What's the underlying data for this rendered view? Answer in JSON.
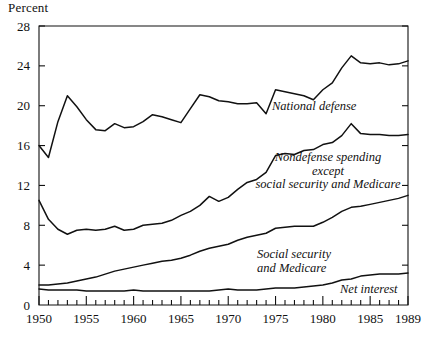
{
  "chart_data": {
    "type": "line",
    "title": "",
    "subtitle": "",
    "unit_label": "Percent",
    "xlabel": "",
    "ylabel": "Percent",
    "xlim": [
      1950,
      1989
    ],
    "ylim": [
      0,
      28
    ],
    "ytick_step": 4,
    "grid": false,
    "legend_position": "inline-annotations",
    "x_major_ticks": [
      1950,
      1955,
      1960,
      1965,
      1970,
      1975,
      1980,
      1985,
      1989
    ],
    "x_tick_labels": [
      "1950",
      "1955",
      "1960",
      "1965",
      "1970",
      "1975",
      "1980",
      "1985",
      "1989"
    ],
    "y_tick_labels": [
      "0",
      "4",
      "8",
      "12",
      "16",
      "20",
      "24",
      "28"
    ],
    "y_ticks": [
      0,
      4,
      8,
      12,
      16,
      20,
      24,
      28
    ],
    "x": [
      1950,
      1951,
      1952,
      1953,
      1954,
      1955,
      1956,
      1957,
      1958,
      1959,
      1960,
      1961,
      1962,
      1963,
      1964,
      1965,
      1966,
      1967,
      1968,
      1969,
      1970,
      1971,
      1972,
      1973,
      1974,
      1975,
      1976,
      1977,
      1978,
      1979,
      1980,
      1981,
      1982,
      1983,
      1984,
      1985,
      1986,
      1987,
      1988,
      1989
    ],
    "series": [
      {
        "name": "National defense",
        "annotation": "National defense",
        "values": [
          16.0,
          14.8,
          18.4,
          21.0,
          19.9,
          18.6,
          17.6,
          17.5,
          18.2,
          17.8,
          17.9,
          18.4,
          19.1,
          18.9,
          18.6,
          18.3,
          19.7,
          21.1,
          20.9,
          20.5,
          20.4,
          20.2,
          20.2,
          20.3,
          19.2,
          21.6,
          21.4,
          21.2,
          21.0,
          20.6,
          21.6,
          22.3,
          23.8,
          25.0,
          24.3,
          24.2,
          24.3,
          24.1,
          24.2,
          24.5
        ]
      },
      {
        "name": "Nondefense spending except social security and Medicare",
        "annotation": [
          "Nondefense spending",
          "except",
          "social security and Medicare"
        ],
        "values": [
          10.5,
          8.6,
          7.6,
          7.1,
          7.5,
          7.6,
          7.5,
          7.6,
          7.9,
          7.5,
          7.6,
          8.0,
          8.1,
          8.2,
          8.5,
          9.0,
          9.4,
          10.0,
          10.9,
          10.4,
          10.8,
          11.6,
          12.3,
          12.6,
          13.3,
          15.0,
          15.2,
          15.1,
          15.5,
          15.6,
          16.1,
          16.3,
          17.0,
          18.2,
          17.2,
          17.1,
          17.1,
          17.0,
          17.0,
          17.1
        ]
      },
      {
        "name": "Social security and Medicare",
        "annotation": [
          "Social security",
          "and Medicare"
        ],
        "values": [
          2.0,
          2.0,
          2.1,
          2.2,
          2.4,
          2.6,
          2.8,
          3.1,
          3.4,
          3.6,
          3.8,
          4.0,
          4.2,
          4.4,
          4.5,
          4.7,
          5.0,
          5.4,
          5.7,
          5.9,
          6.1,
          6.5,
          6.8,
          7.0,
          7.2,
          7.7,
          7.8,
          7.9,
          7.9,
          7.9,
          8.3,
          8.8,
          9.4,
          9.8,
          9.9,
          10.1,
          10.3,
          10.5,
          10.7,
          11.0
        ]
      },
      {
        "name": "Net interest",
        "annotation": "Net interest",
        "values": [
          1.6,
          1.5,
          1.5,
          1.5,
          1.5,
          1.4,
          1.4,
          1.4,
          1.4,
          1.4,
          1.5,
          1.4,
          1.4,
          1.4,
          1.4,
          1.4,
          1.4,
          1.4,
          1.4,
          1.5,
          1.6,
          1.5,
          1.5,
          1.5,
          1.6,
          1.7,
          1.7,
          1.7,
          1.8,
          1.9,
          2.0,
          2.2,
          2.5,
          2.6,
          2.9,
          3.0,
          3.1,
          3.1,
          3.1,
          3.2
        ]
      }
    ],
    "line_color": "#111111",
    "axis_color": "#111111",
    "background_color": "#ffffff"
  },
  "annotations": {
    "national_defense": "National defense",
    "nondefense_line1": "Nondefense spending",
    "nondefense_line2": "except",
    "nondefense_line3": "social security and Medicare",
    "social_security_line1": "Social security",
    "social_security_line2": "and Medicare",
    "net_interest": "Net interest"
  }
}
